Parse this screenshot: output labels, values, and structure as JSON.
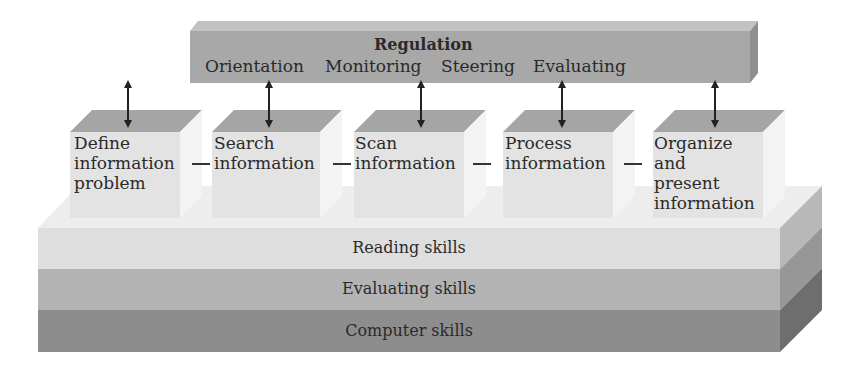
{
  "regulation": {
    "title": "Regulation",
    "phases": [
      "Orientation",
      "Monitoring",
      "Steering",
      "Evaluating"
    ]
  },
  "steps": [
    {
      "lines": [
        "Define",
        "information",
        "problem"
      ]
    },
    {
      "lines": [
        "Search",
        "information"
      ]
    },
    {
      "lines": [
        "Scan",
        "information"
      ]
    },
    {
      "lines": [
        "Process",
        "information"
      ]
    },
    {
      "lines": [
        "Organize",
        "and",
        "present",
        "information"
      ]
    }
  ],
  "skills": {
    "layers": [
      "Reading skills",
      "Evaluating skills",
      "Computer skills"
    ]
  },
  "colors": {
    "regulation_bar": "#a9a9a9",
    "box_top": "#a6a6a6",
    "box_front": "#e4e4e4",
    "reading": "#e0e0e0",
    "evaluating": "#b5b5b5",
    "computer": "#8e8e8e"
  }
}
